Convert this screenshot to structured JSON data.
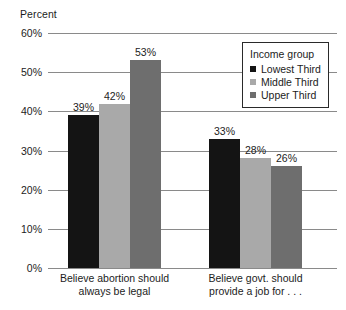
{
  "chart_data": {
    "type": "bar",
    "title": "",
    "subtitle": "",
    "xlabel": "",
    "ylabel": "Percent",
    "ylim": [
      0,
      60
    ],
    "ytick_step": 10,
    "ytick_labels": [
      "0%",
      "10%",
      "20%",
      "30%",
      "40%",
      "50%",
      "60%"
    ],
    "ytick_values": [
      0,
      10,
      20,
      30,
      40,
      50,
      60
    ],
    "grid": true,
    "legend_position": "top-right",
    "legend_title": "Income group",
    "categories": [
      "Believe abortion should always be legal",
      "Believe govt. should provide a job for . . ."
    ],
    "category_lines": [
      [
        "Believe abortion should",
        "always be legal"
      ],
      [
        "Believe govt. should",
        "provide a job for . . ."
      ]
    ],
    "series": [
      {
        "name": "Lowest Third",
        "values": [
          39,
          33
        ],
        "labels": [
          "39%",
          "33%"
        ],
        "color": "#141414"
      },
      {
        "name": "Middle Third",
        "values": [
          42,
          28
        ],
        "labels": [
          "42%",
          "28%"
        ],
        "color": "#a9a9a9"
      },
      {
        "name": "Upper Third",
        "values": [
          53,
          26
        ],
        "labels": [
          "53%",
          "26%"
        ],
        "color": "#6e6e6e"
      }
    ],
    "value_suffix": "%",
    "axis_color": "#8a8a8a"
  }
}
